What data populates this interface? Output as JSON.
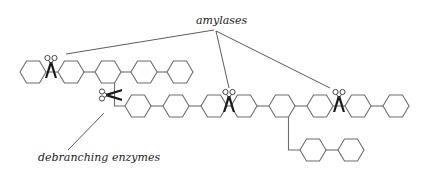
{
  "diagram": {
    "labels": {
      "amylases": "amylases",
      "debranching": "debranching enzymes"
    },
    "colors": {
      "ring_stroke": "#6e6e6e",
      "leader_stroke": "#4a4a4a",
      "scissors": "#1a1a1a",
      "text": "#222222",
      "background": "#ffffff"
    },
    "top_chain": {
      "y": 72,
      "ring_centers_x": [
        33,
        71,
        108,
        144,
        180
      ],
      "amylase_cut_x": 51
    },
    "main_chain": {
      "y": 106,
      "ring_centers_x": [
        138,
        176,
        214,
        244,
        282,
        320,
        358,
        396
      ],
      "amylase_cut_x": [
        229,
        339
      ]
    },
    "side_branch": {
      "y": 150,
      "ring_centers_x": [
        313,
        351
      ]
    },
    "debranching_cut": {
      "x": 108,
      "y": 96
    }
  }
}
